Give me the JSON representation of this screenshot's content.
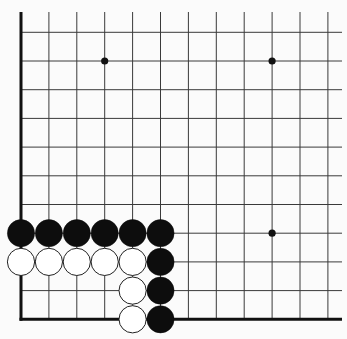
{
  "board": {
    "description": "Go board fragment (lower-left corner)",
    "background_color": "#fbfbfb",
    "line_color": "#3a3a3a",
    "border_color": "#111111",
    "columns_x": [
      21,
      48.9,
      76.8,
      104.7,
      132.6,
      160.5,
      188.4,
      216.3,
      244.2,
      272.1,
      300,
      327.9
    ],
    "rows_y": [
      32.3,
      61,
      89.7,
      118.4,
      147.1,
      175.8,
      204.5,
      233.2,
      261.9,
      290.6,
      319.3
    ],
    "line_top": 12,
    "line_right": 342,
    "left_edge": true,
    "bottom_edge": true,
    "star_points": [
      {
        "col": 3,
        "row": 1
      },
      {
        "col": 9,
        "row": 1
      },
      {
        "col": 9,
        "row": 7
      }
    ],
    "stone_radius": 13.6,
    "stones": [
      {
        "col": 0,
        "row": 7,
        "color": "black"
      },
      {
        "col": 1,
        "row": 7,
        "color": "black"
      },
      {
        "col": 2,
        "row": 7,
        "color": "black"
      },
      {
        "col": 3,
        "row": 7,
        "color": "black"
      },
      {
        "col": 4,
        "row": 7,
        "color": "black"
      },
      {
        "col": 5,
        "row": 7,
        "color": "black"
      },
      {
        "col": 0,
        "row": 8,
        "color": "white"
      },
      {
        "col": 1,
        "row": 8,
        "color": "white"
      },
      {
        "col": 2,
        "row": 8,
        "color": "white"
      },
      {
        "col": 3,
        "row": 8,
        "color": "white"
      },
      {
        "col": 4,
        "row": 8,
        "color": "white"
      },
      {
        "col": 5,
        "row": 8,
        "color": "black"
      },
      {
        "col": 4,
        "row": 9,
        "color": "white"
      },
      {
        "col": 5,
        "row": 9,
        "color": "black"
      },
      {
        "col": 4,
        "row": 10,
        "color": "white"
      },
      {
        "col": 5,
        "row": 10,
        "color": "black"
      }
    ],
    "stone_colors": {
      "black": "#0d0d0d",
      "white": "#ffffff"
    }
  }
}
